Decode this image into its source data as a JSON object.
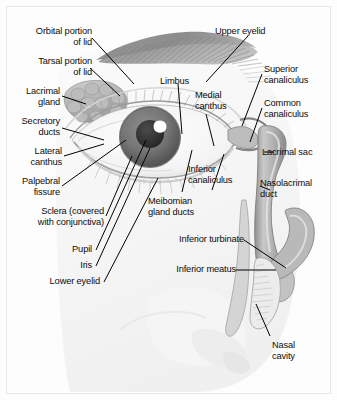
{
  "figure": {
    "background_color": "#fcfcfc",
    "frame_color": "#e7e7e7",
    "text_color": "#0d0d0d",
    "style": "grayscale medical illustration"
  },
  "labels": {
    "orbital_portion_of_lid": "Orbital portion\nof lid",
    "tarsal_portion_of_lid": "Tarsal portion\nof lid",
    "lacrimal_gland": "Lacrimal\ngland",
    "secretory_ducts": "Secretory\nducts",
    "lateral_canthus": "Lateral\ncanthus",
    "palpebral_fissure": "Palpebral\nfissure",
    "sclera": "Sclera (covered\nwith conjunctiva)",
    "pupil": "Pupil",
    "iris": "Iris",
    "lower_eyelid": "Lower eyelid",
    "limbus": "Limbus",
    "medial_canthus": "Medial\ncanthus",
    "meibomian_gland_ducts": "Meibomian\ngland ducts",
    "inferior_canaliculus": "Inferior\ncanaliculus",
    "upper_eyelid": "Upper eyelid",
    "superior_canaliculus": "Superior\ncanaliculus",
    "common_canaliculus": "Common\ncanaliculus",
    "lacrimal_sac": "Lacrimal sac",
    "nasolacrimal_duct": "Nasolacrimal\nduct",
    "inferior_turbinate": "Inferior turbinate",
    "inferior_meatus": "Inferior meatus",
    "nasal_cavity": "Nasal\ncavity"
  },
  "structures": {
    "eyebrow": "eyebrow",
    "eye_globe": "eye-globe",
    "iris_shape": "iris",
    "pupil_shape": "pupil",
    "corneal_highlight": "corneal-highlight",
    "lacrimal_gland_shape": "lacrimal-gland",
    "upper_lashes": "upper-eyelashes",
    "lower_lashes": "lower-eyelashes",
    "lacrimal_sac_shape": "lacrimal-sac",
    "nasolacrimal_duct_shape": "nasolacrimal-duct",
    "inferior_turbinate_shape": "inferior-turbinate",
    "nose_profile": "nose-profile"
  }
}
